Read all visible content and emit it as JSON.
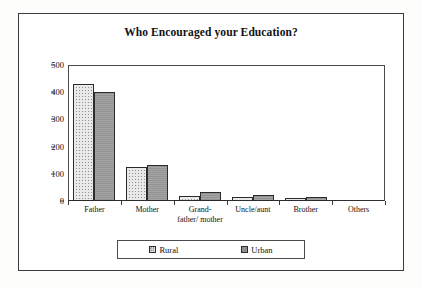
{
  "chart_data": {
    "type": "bar",
    "title": "Who Encouraged your Education?",
    "xlabel": "",
    "ylabel": "No. of subjects",
    "categories": [
      "Father",
      "Mother",
      "Grand-father/mother",
      "Uncle/aunt",
      "Brother",
      "Others"
    ],
    "category_labels": [
      {
        "line1": "Father",
        "line2": ""
      },
      {
        "line1": "Mother",
        "line2": ""
      },
      {
        "line1": "Grand-",
        "line2": "father/ mother"
      },
      {
        "line1": "Uncle/aunt",
        "line2": ""
      },
      {
        "line1": "Brother",
        "line2": ""
      },
      {
        "line1": "Others",
        "line2": ""
      }
    ],
    "series": [
      {
        "name": "Rural",
        "values": [
          430,
          126,
          18,
          13,
          10,
          0
        ],
        "color": "#e9e9e9",
        "pattern": "dotted"
      },
      {
        "name": "Urban",
        "values": [
          401,
          131,
          32,
          22,
          16,
          0
        ],
        "color": "#9b9b9b",
        "pattern": "solid"
      }
    ],
    "ylim": [
      0,
      500
    ],
    "yticks": [
      0,
      100,
      200,
      300,
      400,
      500
    ],
    "ytick_labels": [
      "0",
      "100",
      "200",
      "300",
      "400",
      "500"
    ],
    "grid": false,
    "legend_position": "bottom",
    "legend": [
      "Rural",
      "Urban"
    ]
  }
}
